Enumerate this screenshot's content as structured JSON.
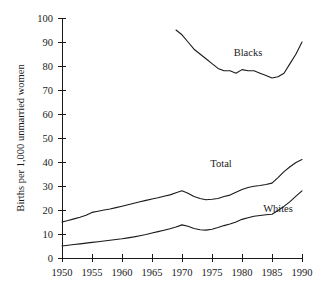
{
  "chart_data": {
    "type": "line",
    "title": "",
    "subtitle": "",
    "xlabel": "",
    "ylabel": "Births per 1,000 unmarried women",
    "xlim": [
      1950,
      1990
    ],
    "ylim": [
      0,
      100
    ],
    "xticks": [
      1950,
      1955,
      1960,
      1965,
      1970,
      1975,
      1980,
      1985,
      1990
    ],
    "yticks": [
      0,
      10,
      20,
      30,
      40,
      50,
      60,
      70,
      80,
      90,
      100
    ],
    "xtick_labels": [
      "1950",
      "1955",
      "1960",
      "1965",
      "1970",
      "1975",
      "1980",
      "1985",
      "1990"
    ],
    "ytick_labels": [
      "0",
      "10",
      "20",
      "30",
      "40",
      "50",
      "60",
      "70",
      "80",
      "90",
      "100"
    ],
    "grid": false,
    "legend_position": "inline-annotation",
    "line_color": "#1a1a1a",
    "series": [
      {
        "name": "Blacks",
        "label": "Blacks",
        "label_x": 1981,
        "label_y": 84,
        "x": [
          1969,
          1970,
          1971,
          1972,
          1973,
          1974,
          1975,
          1976,
          1977,
          1978,
          1979,
          1980,
          1981,
          1982,
          1983,
          1984,
          1985,
          1986,
          1987,
          1988,
          1989,
          1990
        ],
        "y": [
          95,
          93,
          90,
          87,
          85,
          83,
          81,
          79,
          78,
          78,
          77,
          78.5,
          78,
          78,
          77,
          76,
          75,
          75.5,
          77,
          81,
          85,
          90
        ]
      },
      {
        "name": "Total",
        "label": "Total",
        "label_x": 1976.5,
        "label_y": 38,
        "x": [
          1950,
          1951,
          1952,
          1953,
          1954,
          1955,
          1956,
          1957,
          1958,
          1959,
          1960,
          1961,
          1962,
          1963,
          1964,
          1965,
          1966,
          1967,
          1968,
          1969,
          1970,
          1971,
          1972,
          1973,
          1974,
          1975,
          1976,
          1977,
          1978,
          1979,
          1980,
          1981,
          1982,
          1983,
          1984,
          1985,
          1986,
          1987,
          1988,
          1989,
          1990
        ],
        "y": [
          15,
          15.6,
          16.3,
          17,
          17.8,
          19,
          19.5,
          20,
          20.4,
          21,
          21.6,
          22.2,
          22.8,
          23.4,
          24,
          24.6,
          25.1,
          25.7,
          26.3,
          27.2,
          28,
          27,
          25.6,
          24.8,
          24.3,
          24.5,
          24.8,
          25.6,
          26.2,
          27.4,
          28.5,
          29.4,
          29.9,
          30.2,
          30.6,
          31.2,
          33.5,
          36,
          38,
          39.8,
          41
        ]
      },
      {
        "name": "Whites",
        "label": "Whites",
        "label_x": 1986,
        "label_y": 19,
        "x": [
          1950,
          1951,
          1952,
          1953,
          1954,
          1955,
          1956,
          1957,
          1958,
          1959,
          1960,
          1961,
          1962,
          1963,
          1964,
          1965,
          1966,
          1967,
          1968,
          1969,
          1970,
          1971,
          1972,
          1973,
          1974,
          1975,
          1976,
          1977,
          1978,
          1979,
          1980,
          1981,
          1982,
          1983,
          1984,
          1985,
          1986,
          1987,
          1988,
          1989,
          1990
        ],
        "y": [
          5,
          5.3,
          5.6,
          5.9,
          6.2,
          6.5,
          6.8,
          7.1,
          7.4,
          7.7,
          8,
          8.4,
          8.8,
          9.3,
          9.8,
          10.4,
          11,
          11.6,
          12.2,
          12.9,
          13.8,
          13.2,
          12.3,
          11.8,
          11.6,
          12,
          12.7,
          13.5,
          14.2,
          15,
          16.1,
          16.8,
          17.4,
          17.7,
          18,
          18.2,
          19.8,
          21.5,
          23.5,
          25.8,
          28
        ]
      }
    ]
  }
}
